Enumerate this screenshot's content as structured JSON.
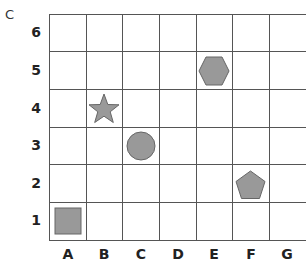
{
  "corner_label": "C",
  "grid": {
    "columns": [
      "A",
      "B",
      "C",
      "D",
      "E",
      "F",
      "G"
    ],
    "rows": [
      "6",
      "5",
      "4",
      "3",
      "2",
      "1"
    ],
    "line_color": "#555555"
  },
  "shapes": [
    {
      "type": "square",
      "col": "A",
      "row": "1",
      "fill": "#999999",
      "stroke": "#666666"
    },
    {
      "type": "star",
      "col": "B",
      "row": "4",
      "fill": "#999999",
      "stroke": "#666666"
    },
    {
      "type": "circle",
      "col": "C",
      "row": "3",
      "fill": "#999999",
      "stroke": "#666666"
    },
    {
      "type": "hexagon",
      "col": "E",
      "row": "5",
      "fill": "#999999",
      "stroke": "#666666"
    },
    {
      "type": "pentagon",
      "col": "F",
      "row": "2",
      "fill": "#999999",
      "stroke": "#666666"
    }
  ]
}
